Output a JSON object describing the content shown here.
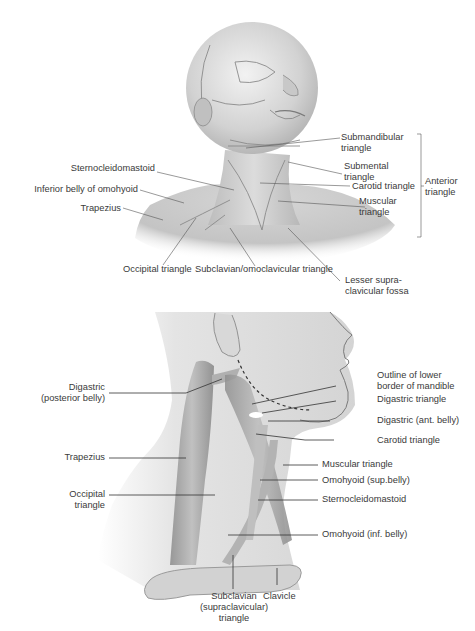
{
  "figure_top": {
    "title": "Neck triangles (anterolateral view)",
    "labels": [
      {
        "id": "submandibular",
        "text": "Submandibular\ntriangle"
      },
      {
        "id": "submental",
        "text": "Submental\ntriangle"
      },
      {
        "id": "carotid",
        "text": "Carotid triangle"
      },
      {
        "id": "muscular",
        "text": "Muscular\ntriangle"
      },
      {
        "id": "anterior",
        "text": "Anterior\ntriangle"
      },
      {
        "id": "sternocleidomastoid",
        "text": "Sternocleidomastoid"
      },
      {
        "id": "inferior_belly_omohyoid",
        "text": "Inferior belly of omohyoid"
      },
      {
        "id": "trapezius",
        "text": "Trapezius"
      },
      {
        "id": "occipital",
        "text": "Occipital triangle"
      },
      {
        "id": "subclavian_omoclavicular",
        "text": "Subclavian/omoclavicular triangle"
      },
      {
        "id": "lesser_supraclavicular",
        "text": "Lesser supra-\nclavicular fossa"
      }
    ]
  },
  "figure_bottom": {
    "title": "Neck triangles (lateral view)",
    "labels": [
      {
        "id": "digastric_post",
        "text": "Digastric\n(posterior belly)"
      },
      {
        "id": "trapezius",
        "text": "Trapezius"
      },
      {
        "id": "occipital",
        "text": "Occipital\ntriangle"
      },
      {
        "id": "outline_mandible",
        "text": "Outline of lower\nborder of mandible"
      },
      {
        "id": "digastric_triangle",
        "text": "Digastric triangle"
      },
      {
        "id": "digastric_ant",
        "text": "Digastric (ant. belly)"
      },
      {
        "id": "carotid",
        "text": "Carotid triangle"
      },
      {
        "id": "muscular",
        "text": "Muscular triangle"
      },
      {
        "id": "omohyoid_sup",
        "text": "Omohyoid (sup.belly)"
      },
      {
        "id": "sternocleidomastoid",
        "text": "Sternocleidomastoid"
      },
      {
        "id": "omohyoid_inf",
        "text": "Omohyoid (inf. belly)"
      },
      {
        "id": "subclavian",
        "text": "Subclavian\n(supraclavicular)\ntriangle"
      },
      {
        "id": "clavicle",
        "text": "Clavicle"
      }
    ]
  },
  "colors": {
    "skin_light": "#ededed",
    "skin_mid": "#cfcfcf",
    "skin_dark": "#9a9a9a",
    "muscle": "#a9a9a9",
    "leader_line": "#3a3a3a",
    "label_text": "#3a3a3a"
  }
}
